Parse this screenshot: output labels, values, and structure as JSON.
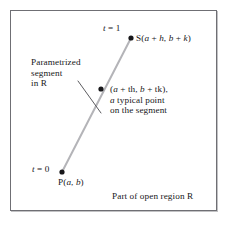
{
  "figure": {
    "type": "math-diagram",
    "caption": "Part of open region R",
    "frame": {
      "border_color": "#6f6f74",
      "background": "#ffffff"
    },
    "labels": {
      "t_end": "t = 1",
      "point_s": "S(a + h, b + k)",
      "annotation_line1": "Parametrized",
      "annotation_line2": "segment",
      "annotation_line3": "in R",
      "midpoint_coords": "(a + th, b + tk),",
      "midpoint_desc1": "a typical point",
      "midpoint_desc2": "on the segment",
      "t_start": "t = 0",
      "point_p": "P(a, b)"
    }
  },
  "chart_data": {
    "type": "scatter",
    "title": "",
    "xlabel": "",
    "ylabel": "",
    "grid": false,
    "legend": "none",
    "xlim": [
      0,
      228
    ],
    "ylim": [
      0,
      229
    ],
    "segment": {
      "name": "Parametrized segment in R",
      "color": "#b4b4b8",
      "from": [
        62,
        172
      ],
      "to": [
        131,
        38
      ]
    },
    "points": [
      {
        "name": "P(a, b)",
        "t": 0,
        "x": 62,
        "y": 172,
        "color": "#17171a"
      },
      {
        "name": "(a + th, b + tk)",
        "t": "t",
        "x": 101,
        "y": 89,
        "color": "#17171a"
      },
      {
        "name": "S(a + h, b + k)",
        "t": 1,
        "x": 131,
        "y": 38,
        "color": "#17171a"
      }
    ],
    "leader_line": {
      "name": "annotation-leader",
      "color": "#4a4a4e",
      "from": [
        78,
        81
      ],
      "to": [
        101,
        113
      ]
    }
  }
}
